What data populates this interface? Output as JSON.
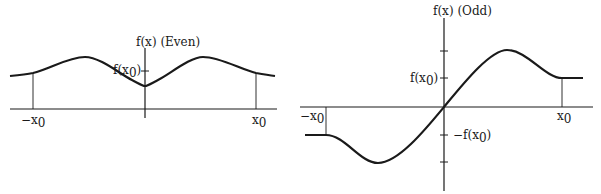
{
  "even_graph": {
    "title": "f(x) (Even)",
    "y_label_main": "f(x",
    "y_label_sub": "0",
    "y_label_close": ")",
    "x_neg_main": "−x",
    "x_neg_sub": "0",
    "x_pos_main": "x",
    "x_pos_sub": "0"
  },
  "odd_graph": {
    "title": "f(x) (Odd)",
    "pos_label_main": "f(x",
    "pos_label_sub": "0",
    "pos_label_close": ")",
    "neg_label_main": "−f(x",
    "neg_label_sub": "0",
    "neg_label_close": ")",
    "x_neg_main": "−x",
    "x_neg_sub": "0",
    "x_pos_main": "x",
    "x_pos_sub": "0"
  },
  "colors": {
    "ink": "#1a1a1a",
    "background": "#ffffff"
  }
}
